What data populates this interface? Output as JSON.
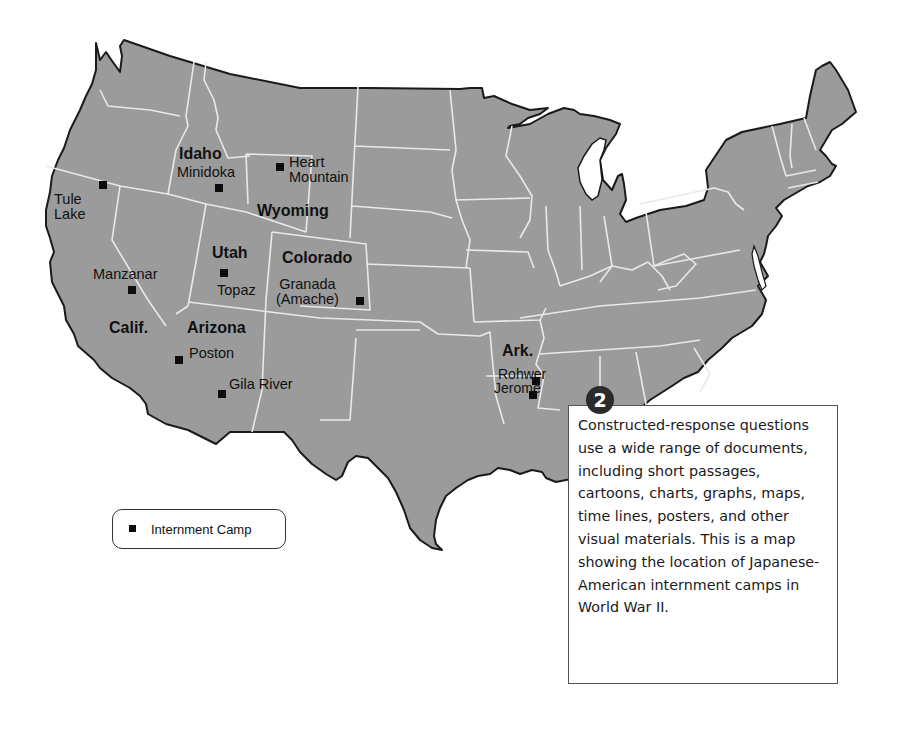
{
  "map": {
    "title": "Japanese-American Internment Camps, World War II",
    "colors": {
      "land": "#9b9b9b",
      "state_borders": "#e9e9e9",
      "coastline": "#1a1a1a",
      "water": "#ffffff",
      "marker": "#0d0d0d"
    },
    "states": [
      {
        "id": "idaho",
        "label": "Idaho"
      },
      {
        "id": "wyoming",
        "label": "Wyoming"
      },
      {
        "id": "utah",
        "label": "Utah"
      },
      {
        "id": "colorado",
        "label": "Colorado"
      },
      {
        "id": "california",
        "label": "Calif."
      },
      {
        "id": "arizona",
        "label": "Arizona"
      },
      {
        "id": "arkansas",
        "label": "Ark."
      }
    ],
    "camps": [
      {
        "id": "tule-lake",
        "line1": "Tule",
        "line2": "Lake"
      },
      {
        "id": "minidoka",
        "line1": "Minidoka"
      },
      {
        "id": "heart-mountain",
        "line1": "Heart",
        "line2": "Mountain"
      },
      {
        "id": "manzanar",
        "line1": "Manzanar"
      },
      {
        "id": "topaz",
        "line1": "Topaz"
      },
      {
        "id": "granada",
        "line1": "Granada",
        "line2": "(Amache)"
      },
      {
        "id": "poston",
        "line1": "Poston"
      },
      {
        "id": "gila-river",
        "line1": "Gila River"
      },
      {
        "id": "rohwer",
        "line1": "Rohwer"
      },
      {
        "id": "jerome",
        "line1": "Jerome"
      }
    ]
  },
  "legend": {
    "marker_icon": "square-marker",
    "label": "Internment Camp"
  },
  "callout": {
    "badge": "2",
    "text": "Constructed-response questions use a wide range of documents, including short passages, cartoons, charts, graphs, maps, time lines, posters, and other visual materials. This is a map showing the location of Japanese-American internment camps in World War II."
  }
}
